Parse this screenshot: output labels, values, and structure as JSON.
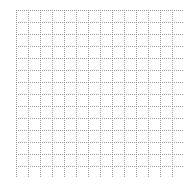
{
  "grid": {
    "origin_x": 16,
    "origin_y": 10,
    "cell_size": 12,
    "columns": 14,
    "rows": 14,
    "line_color": "#9a9a9a",
    "background_color": "#ffffff",
    "line_style": "dotted"
  }
}
